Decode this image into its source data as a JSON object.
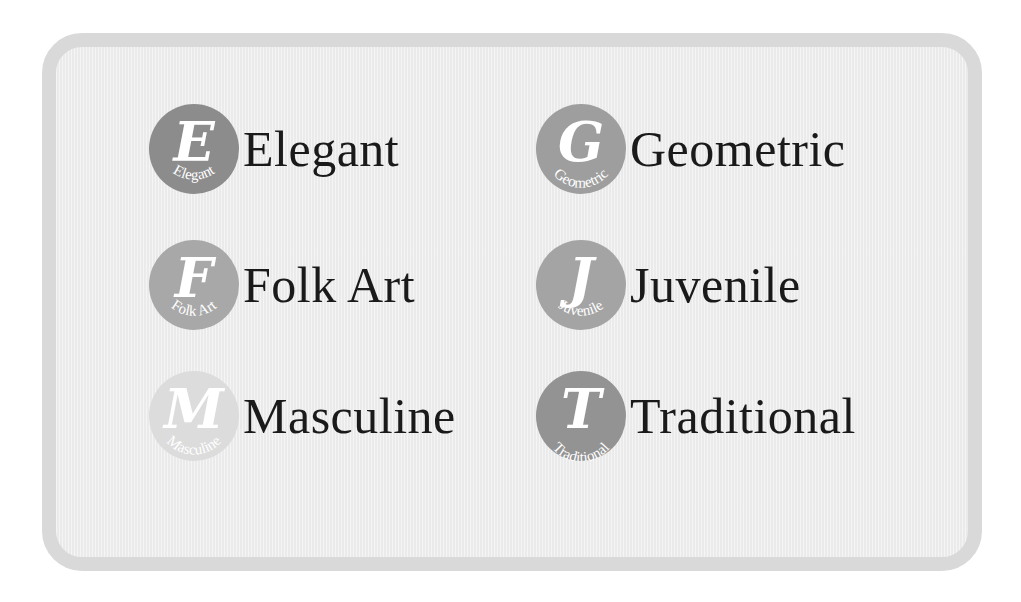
{
  "styles": [
    {
      "id": "elegant",
      "letter": "E",
      "label": "Elegant",
      "badge_text": "Elegant",
      "color": "#8c8c8c",
      "icon": "elegant-badge-icon"
    },
    {
      "id": "geometric",
      "letter": "G",
      "label": "Geometric",
      "badge_text": "Geometric",
      "color": "#9e9e9e",
      "icon": "geometric-badge-icon"
    },
    {
      "id": "folk-art",
      "letter": "F",
      "label": "Folk Art",
      "badge_text": "Folk Art",
      "color": "#a8a8a8",
      "icon": "folk-art-badge-icon"
    },
    {
      "id": "juvenile",
      "letter": "J",
      "label": "Juvenile",
      "badge_text": "Juvenile",
      "color": "#a4a4a4",
      "icon": "juvenile-badge-icon"
    },
    {
      "id": "masculine",
      "letter": "M",
      "label": "Masculine",
      "badge_text": "Masculine",
      "color": "#dcdcdc",
      "icon": "masculine-badge-icon"
    },
    {
      "id": "traditional",
      "letter": "T",
      "label": "Traditional",
      "badge_text": "Traditional",
      "color": "#939393",
      "icon": "traditional-badge-icon"
    }
  ],
  "frame": {
    "border_color": "#d9d9d9",
    "background": "#efefef"
  }
}
